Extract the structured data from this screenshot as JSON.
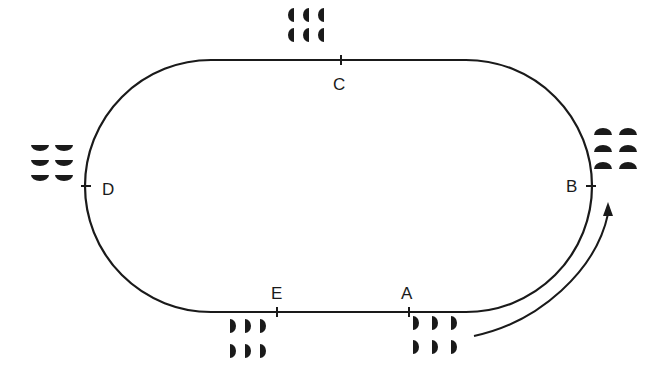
{
  "diagram": {
    "type": "oval-track",
    "stroke_color": "#1a1a1a",
    "background": "#ffffff",
    "track": {
      "top_y": 60,
      "bottom_y": 312,
      "left_x": 85,
      "right_x": 592
    },
    "points": [
      {
        "id": "A",
        "label": "A",
        "x": 409,
        "y": 312,
        "label_x": 401,
        "label_y": 286
      },
      {
        "id": "B",
        "label": "B",
        "x": 591,
        "y": 186,
        "label_x": 566,
        "label_y": 178
      },
      {
        "id": "C",
        "label": "C",
        "x": 341,
        "y": 60,
        "label_x": 333,
        "label_y": 76
      },
      {
        "id": "D",
        "label": "D",
        "x": 86,
        "y": 186,
        "label_x": 102,
        "label_y": 182
      },
      {
        "id": "E",
        "label": "E",
        "x": 277,
        "y": 312,
        "label_x": 271,
        "label_y": 286
      }
    ],
    "groups": [
      {
        "near": "C",
        "orientation": "facing-left",
        "rows": 2,
        "cols": 3,
        "x0": 292,
        "y0": 15,
        "dx": 15,
        "dy": 20
      },
      {
        "near": "D",
        "orientation": "facing-down",
        "rows": 3,
        "cols": 2,
        "x0": 40,
        "y0": 148,
        "dx": 24,
        "dy": 15
      },
      {
        "near": "B",
        "orientation": "facing-up",
        "rows": 3,
        "cols": 2,
        "x0": 603,
        "y0": 132,
        "dx": 25,
        "dy": 17
      },
      {
        "near": "E",
        "orientation": "facing-right",
        "rows": 2,
        "cols": 3,
        "x0": 232,
        "y0": 326,
        "dx": 15,
        "dy": 25
      },
      {
        "near": "A",
        "orientation": "facing-right",
        "rows": 2,
        "cols": 3,
        "x0": 415,
        "y0": 323,
        "dx": 19,
        "dy": 24
      }
    ],
    "arrow": {
      "from": "A",
      "to": "B",
      "direction": "counter-clockwise"
    }
  }
}
